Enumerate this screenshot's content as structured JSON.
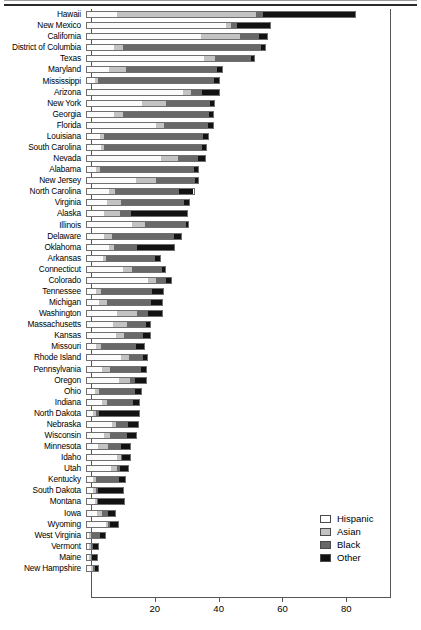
{
  "chart_data": {
    "type": "bar",
    "orientation": "horizontal",
    "stacked": true,
    "title": "",
    "xlabel": "",
    "ylabel": "",
    "xlim": [
      0,
      94
    ],
    "grid": false,
    "xticks": [
      20,
      40,
      60,
      80
    ],
    "xticklabels": [
      "20",
      "40",
      "60",
      "80"
    ],
    "legend_position": "inside-right",
    "series": [
      {
        "name": "Hispanic",
        "color": "#ffffff"
      },
      {
        "name": "Asian",
        "color": "#c3c3c3"
      },
      {
        "name": "Black",
        "color": "#696969"
      },
      {
        "name": "Other",
        "color": "#121212"
      }
    ],
    "categories": [
      "Hawaii",
      "New Mexico",
      "California",
      "District of Columbia",
      "Texas",
      "Maryland",
      "Mississippi",
      "Arizona",
      "New York",
      "Georgia",
      "Florida",
      "Louisiana",
      "South Carolina",
      "Nevada",
      "Alabama",
      "New Jersey",
      "North Carolina",
      "Virginia",
      "Alaska",
      "Illinois",
      "Delaware",
      "Oklahoma",
      "Arkansas",
      "Connecticut",
      "Colorado",
      "Tennessee",
      "Michigan",
      "Washington",
      "Massachusetts",
      "Kansas",
      "Missouri",
      "Rhode Island",
      "Pennsylvania",
      "Oregon",
      "Ohio",
      "Indiana",
      "North Dakota",
      "Nebraska",
      "Wisconsin",
      "Minnesota",
      "Idaho",
      "Utah",
      "Kentucky",
      "South Dakota",
      "Montana",
      "Iowa",
      "Wyoming",
      "West Virginia",
      "Vermont",
      "Maine",
      "New Hampshire"
    ],
    "rows": [
      {
        "state": "Hawaii",
        "hispanic": 9.5,
        "asian": 44.0,
        "black": 2.0,
        "other": 29.0,
        "total": 84.5
      },
      {
        "state": "New Mexico",
        "hispanic": 44.0,
        "asian": 1.5,
        "black": 2.0,
        "other": 10.5,
        "total": 58.0
      },
      {
        "state": "California",
        "hispanic": 36.0,
        "asian": 12.5,
        "black": 6.0,
        "other": 2.5,
        "total": 57.0
      },
      {
        "state": "District of Columbia",
        "hispanic": 8.5,
        "asian": 3.0,
        "black": 43.5,
        "other": 1.5,
        "total": 56.5
      },
      {
        "state": "Texas",
        "hispanic": 37.0,
        "asian": 3.5,
        "black": 11.5,
        "other": 1.0,
        "total": 53.0
      },
      {
        "state": "Maryland",
        "hispanic": 7.0,
        "asian": 5.5,
        "black": 29.0,
        "other": 1.5,
        "total": 43.0
      },
      {
        "state": "Mississippi",
        "hispanic": 2.5,
        "asian": 1.0,
        "black": 37.0,
        "other": 1.5,
        "total": 42.0
      },
      {
        "state": "Arizona",
        "hispanic": 30.5,
        "asian": 2.5,
        "black": 3.5,
        "other": 5.5,
        "total": 42.0
      },
      {
        "state": "New York",
        "hispanic": 17.5,
        "asian": 7.5,
        "black": 14.0,
        "other": 1.5,
        "total": 40.5
      },
      {
        "state": "Georgia",
        "hispanic": 8.5,
        "asian": 3.0,
        "black": 27.5,
        "other": 1.0,
        "total": 40.0
      },
      {
        "state": "Florida",
        "hispanic": 22.0,
        "asian": 2.5,
        "black": 14.0,
        "other": 1.5,
        "total": 40.0
      },
      {
        "state": "Louisiana",
        "hispanic": 4.0,
        "asian": 1.5,
        "black": 31.5,
        "other": 1.5,
        "total": 38.5
      },
      {
        "state": "South Carolina",
        "hispanic": 4.5,
        "asian": 1.0,
        "black": 31.0,
        "other": 1.5,
        "total": 38.0
      },
      {
        "state": "Nevada",
        "hispanic": 23.5,
        "asian": 5.5,
        "black": 6.5,
        "other": 2.0,
        "total": 37.5
      },
      {
        "state": "Alabama",
        "hispanic": 3.0,
        "asian": 1.0,
        "black": 30.0,
        "other": 1.5,
        "total": 35.5
      },
      {
        "state": "New Jersey",
        "hispanic": 15.5,
        "asian": 6.5,
        "black": 12.5,
        "other": 1.0,
        "total": 35.5
      },
      {
        "state": "North Carolina",
        "hispanic": 7.0,
        "asian": 2.0,
        "black": 20.5,
        "other": 4.5,
        "total": 34.0
      },
      {
        "state": "Virginia",
        "hispanic": 6.5,
        "asian": 4.5,
        "black": 20.0,
        "other": 1.5,
        "total": 32.5
      },
      {
        "state": "Alaska",
        "hispanic": 5.5,
        "asian": 5.0,
        "black": 3.5,
        "other": 18.0,
        "total": 32.0
      },
      {
        "state": "Illinois",
        "hispanic": 14.5,
        "asian": 4.0,
        "black": 13.0,
        "other": 0.8,
        "total": 32.0
      },
      {
        "state": "Delaware",
        "hispanic": 5.5,
        "asian": 2.5,
        "black": 20.0,
        "other": 2.0,
        "total": 30.0
      },
      {
        "state": "Oklahoma",
        "hispanic": 7.0,
        "asian": 1.5,
        "black": 7.5,
        "other": 12.0,
        "total": 28.0
      },
      {
        "state": "Arkansas",
        "hispanic": 5.0,
        "asian": 1.0,
        "black": 16.0,
        "other": 1.5,
        "total": 23.5
      },
      {
        "state": "Connecticut",
        "hispanic": 11.5,
        "asian": 3.0,
        "black": 9.5,
        "other": 1.0,
        "total": 25.0
      },
      {
        "state": "Colorado",
        "hispanic": 19.5,
        "asian": 2.5,
        "black": 3.5,
        "other": 1.5,
        "total": 27.0
      },
      {
        "state": "Tennessee",
        "hispanic": 3.0,
        "asian": 1.5,
        "black": 16.5,
        "other": 3.5,
        "total": 24.5
      },
      {
        "state": "Michigan",
        "hispanic": 4.0,
        "asian": 2.5,
        "black": 14.0,
        "other": 3.5,
        "total": 24.0
      },
      {
        "state": "Washington",
        "hispanic": 9.5,
        "asian": 6.5,
        "black": 3.5,
        "other": 4.5,
        "total": 24.0
      },
      {
        "state": "Massachusetts",
        "hispanic": 8.5,
        "asian": 4.5,
        "black": 6.0,
        "other": 1.5,
        "total": 20.5
      },
      {
        "state": "Kansas",
        "hispanic": 9.5,
        "asian": 2.5,
        "black": 6.0,
        "other": 2.5,
        "total": 20.5
      },
      {
        "state": "Missouri",
        "hispanic": 3.0,
        "asian": 1.5,
        "black": 11.5,
        "other": 2.5,
        "total": 18.5
      },
      {
        "state": "Rhode Island",
        "hispanic": 11.0,
        "asian": 2.5,
        "black": 4.5,
        "other": 1.5,
        "total": 19.5
      },
      {
        "state": "Pennsylvania",
        "hispanic": 5.0,
        "asian": 2.5,
        "black": 10.0,
        "other": 1.5,
        "total": 19.0
      },
      {
        "state": "Oregon",
        "hispanic": 10.5,
        "asian": 3.5,
        "black": 1.5,
        "other": 3.5,
        "total": 19.0
      },
      {
        "state": "Ohio",
        "hispanic": 2.5,
        "asian": 1.5,
        "black": 11.5,
        "other": 2.0,
        "total": 17.5
      },
      {
        "state": "Indiana",
        "hispanic": 5.0,
        "asian": 1.5,
        "black": 8.5,
        "other": 2.0,
        "total": 17.0
      },
      {
        "state": "North Dakota",
        "hispanic": 2.0,
        "asian": 1.0,
        "black": 1.0,
        "other": 13.0,
        "total": 17.0
      },
      {
        "state": "Nebraska",
        "hispanic": 8.0,
        "asian": 1.5,
        "black": 4.0,
        "other": 3.0,
        "total": 16.5
      },
      {
        "state": "Wisconsin",
        "hispanic": 5.5,
        "asian": 2.0,
        "black": 5.5,
        "other": 3.0,
        "total": 16.0
      },
      {
        "state": "Minnesota",
        "hispanic": 3.5,
        "asian": 3.5,
        "black": 4.0,
        "other": 3.0,
        "total": 14.0
      },
      {
        "state": "Idaho",
        "hispanic": 10.0,
        "asian": 1.0,
        "black": 0.5,
        "other": 2.5,
        "total": 14.0
      },
      {
        "state": "Utah",
        "hispanic": 8.0,
        "asian": 2.0,
        "black": 1.0,
        "other": 2.5,
        "total": 13.5
      },
      {
        "state": "Kentucky",
        "hispanic": 2.0,
        "asian": 1.0,
        "black": 7.5,
        "other": 2.0,
        "total": 12.5
      },
      {
        "state": "South Dakota",
        "hispanic": 2.0,
        "asian": 1.0,
        "black": 0.5,
        "other": 8.5,
        "total": 12.0
      },
      {
        "state": "Montana",
        "hispanic": 2.5,
        "asian": 0.8,
        "black": 0.4,
        "other": 8.5,
        "total": 12.0
      },
      {
        "state": "Iowa",
        "hispanic": 3.5,
        "asian": 1.5,
        "black": 2.0,
        "other": 2.5,
        "total": 9.5
      },
      {
        "state": "Wyoming",
        "hispanic": 6.5,
        "asian": 0.6,
        "black": 0.6,
        "other": 2.5,
        "total": 10.0
      },
      {
        "state": "West Virginia",
        "hispanic": 0.8,
        "asian": 0.6,
        "black": 3.0,
        "other": 2.0,
        "total": 7.0
      },
      {
        "state": "Vermont",
        "hispanic": 0.8,
        "asian": 0.8,
        "black": 0.6,
        "other": 2.0,
        "total": 4.5
      },
      {
        "state": "Maine",
        "hispanic": 0.7,
        "asian": 0.7,
        "black": 0.6,
        "other": 1.8,
        "total": 4.0
      },
      {
        "state": "New Hampshire",
        "hispanic": 1.4,
        "asian": 0.9,
        "black": 0.6,
        "other": 1.2,
        "total": 4.0
      }
    ]
  },
  "legend": {
    "items": [
      {
        "key": "hispanic",
        "label": "Hispanic"
      },
      {
        "key": "asian",
        "label": "Asian"
      },
      {
        "key": "black",
        "label": "Black"
      },
      {
        "key": "other",
        "label": "Other"
      }
    ]
  },
  "axis": {
    "ticks": [
      "20",
      "40",
      "60",
      "80"
    ]
  }
}
